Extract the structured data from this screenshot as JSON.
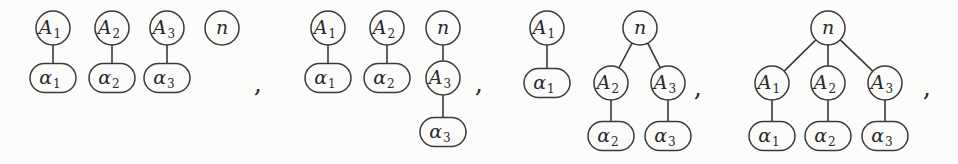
{
  "figure": {
    "kind": "rooted-forest-diagram",
    "background_color": "#fcfcfb",
    "ink_color": "#3a3a3a",
    "width": 958,
    "height": 164,
    "separator": ",",
    "node_shapes": {
      "upper": "circle",
      "leaf": "rounded-rectangle"
    },
    "labels": {
      "n": "n",
      "A1_base": "A",
      "A1_sub": "1",
      "A2_base": "A",
      "A2_sub": "2",
      "A3_base": "A",
      "A3_sub": "3",
      "a1_base": "α",
      "a1_sub": "1",
      "a2_base": "α",
      "a2_sub": "2",
      "a3_base": "α",
      "a3_sub": "3"
    },
    "groups": [
      {
        "name": "forest-1",
        "description": "four disjoint components: A1-alpha1, A2-alpha2, A3-alpha3 and isolated n",
        "nodes": [
          {
            "id": "g1-A1",
            "label_base": "A",
            "label_sub": "1",
            "shape": "circle",
            "cx": 53,
            "cy": 28
          },
          {
            "id": "g1-A2",
            "label_base": "A",
            "label_sub": "2",
            "shape": "circle",
            "cx": 112,
            "cy": 28
          },
          {
            "id": "g1-A3",
            "label_base": "A",
            "label_sub": "3",
            "shape": "circle",
            "cx": 167,
            "cy": 28
          },
          {
            "id": "g1-n",
            "label_base": "n",
            "label_sub": "",
            "shape": "circle",
            "cx": 222,
            "cy": 28
          },
          {
            "id": "g1-a1",
            "label_base": "α",
            "label_sub": "1",
            "shape": "rounded",
            "cx": 53,
            "cy": 78
          },
          {
            "id": "g1-a2",
            "label_base": "α",
            "label_sub": "2",
            "shape": "rounded",
            "cx": 112,
            "cy": 78
          },
          {
            "id": "g1-a3",
            "label_base": "α",
            "label_sub": "3",
            "shape": "rounded",
            "cx": 167,
            "cy": 78
          }
        ],
        "edges": [
          {
            "from": "g1-A1",
            "to": "g1-a1"
          },
          {
            "from": "g1-A2",
            "to": "g1-a2"
          },
          {
            "from": "g1-A3",
            "to": "g1-a3"
          }
        ],
        "separator_x": 258,
        "separator_y": 92
      },
      {
        "name": "forest-2",
        "description": "three components: A1-alpha1, A2-alpha2, and chain n-A3-alpha3",
        "nodes": [
          {
            "id": "g2-A1",
            "label_base": "A",
            "label_sub": "1",
            "shape": "circle",
            "cx": 328,
            "cy": 28
          },
          {
            "id": "g2-A2",
            "label_base": "A",
            "label_sub": "2",
            "shape": "circle",
            "cx": 387,
            "cy": 28
          },
          {
            "id": "g2-n",
            "label_base": "n",
            "label_sub": "",
            "shape": "circle",
            "cx": 443,
            "cy": 28
          },
          {
            "id": "g2-a1",
            "label_base": "α",
            "label_sub": "1",
            "shape": "rounded",
            "cx": 328,
            "cy": 78
          },
          {
            "id": "g2-a2",
            "label_base": "α",
            "label_sub": "2",
            "shape": "rounded",
            "cx": 387,
            "cy": 78
          },
          {
            "id": "g2-A3",
            "label_base": "A",
            "label_sub": "3",
            "shape": "circle",
            "cx": 443,
            "cy": 78
          },
          {
            "id": "g2-a3",
            "label_base": "α",
            "label_sub": "3",
            "shape": "rounded",
            "cx": 443,
            "cy": 132
          }
        ],
        "edges": [
          {
            "from": "g2-A1",
            "to": "g2-a1"
          },
          {
            "from": "g2-A2",
            "to": "g2-a2"
          },
          {
            "from": "g2-n",
            "to": "g2-A3"
          },
          {
            "from": "g2-A3",
            "to": "g2-a3"
          }
        ],
        "separator_x": 479,
        "separator_y": 92
      },
      {
        "name": "forest-3",
        "description": "two components: A1-alpha1, and tree n with children A2-alpha2 and A3-alpha3",
        "nodes": [
          {
            "id": "g3-A1",
            "label_base": "A",
            "label_sub": "1",
            "shape": "circle",
            "cx": 547,
            "cy": 28
          },
          {
            "id": "g3-n",
            "label_base": "n",
            "label_sub": "",
            "shape": "circle",
            "cx": 640,
            "cy": 28
          },
          {
            "id": "g3-a1",
            "label_base": "α",
            "label_sub": "1",
            "shape": "rounded",
            "cx": 547,
            "cy": 83
          },
          {
            "id": "g3-A2",
            "label_base": "A",
            "label_sub": "2",
            "shape": "circle",
            "cx": 611,
            "cy": 83
          },
          {
            "id": "g3-A3",
            "label_base": "A",
            "label_sub": "3",
            "shape": "circle",
            "cx": 668,
            "cy": 83
          },
          {
            "id": "g3-a2",
            "label_base": "α",
            "label_sub": "2",
            "shape": "rounded",
            "cx": 611,
            "cy": 136
          },
          {
            "id": "g3-a3",
            "label_base": "α",
            "label_sub": "3",
            "shape": "rounded",
            "cx": 668,
            "cy": 136
          }
        ],
        "edges": [
          {
            "from": "g3-A1",
            "to": "g3-a1"
          },
          {
            "from": "g3-n",
            "to": "g3-A2"
          },
          {
            "from": "g3-n",
            "to": "g3-A3"
          },
          {
            "from": "g3-A2",
            "to": "g3-a2"
          },
          {
            "from": "g3-A3",
            "to": "g3-a3"
          }
        ],
        "separator_x": 698,
        "separator_y": 96
      },
      {
        "name": "forest-4",
        "description": "single tree: root n with three children A1, A2, A3 each carrying a leaf alpha",
        "nodes": [
          {
            "id": "g4-n",
            "label_base": "n",
            "label_sub": "",
            "shape": "circle",
            "cx": 828,
            "cy": 28
          },
          {
            "id": "g4-A1",
            "label_base": "A",
            "label_sub": "1",
            "shape": "circle",
            "cx": 772,
            "cy": 83
          },
          {
            "id": "g4-A2",
            "label_base": "A",
            "label_sub": "2",
            "shape": "circle",
            "cx": 828,
            "cy": 83
          },
          {
            "id": "g4-A3",
            "label_base": "A",
            "label_sub": "3",
            "shape": "circle",
            "cx": 885,
            "cy": 83
          },
          {
            "id": "g4-a1",
            "label_base": "α",
            "label_sub": "1",
            "shape": "rounded",
            "cx": 772,
            "cy": 136
          },
          {
            "id": "g4-a2",
            "label_base": "α",
            "label_sub": "2",
            "shape": "rounded",
            "cx": 828,
            "cy": 136
          },
          {
            "id": "g4-a3",
            "label_base": "α",
            "label_sub": "3",
            "shape": "rounded",
            "cx": 885,
            "cy": 136
          }
        ],
        "edges": [
          {
            "from": "g4-n",
            "to": "g4-A1"
          },
          {
            "from": "g4-n",
            "to": "g4-A2"
          },
          {
            "from": "g4-n",
            "to": "g4-A3"
          },
          {
            "from": "g4-A1",
            "to": "g4-a1"
          },
          {
            "from": "g4-A2",
            "to": "g4-a2"
          },
          {
            "from": "g4-A3",
            "to": "g4-a3"
          }
        ],
        "separator_x": 927,
        "separator_y": 96
      }
    ]
  }
}
